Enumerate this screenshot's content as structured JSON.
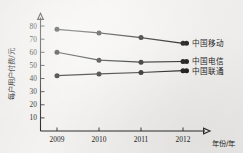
{
  "chart_data": {
    "type": "line",
    "title": "",
    "subtitle": "",
    "xlabel": "年份/年",
    "ylabel": "每户用户付费/元",
    "x": [
      "2009",
      "2010",
      "2011",
      "2012"
    ],
    "xtick_labels": [
      "2009",
      "2010",
      "2011",
      "2012"
    ],
    "ytick_labels": [
      "10",
      "20",
      "30",
      "40",
      "50",
      "60",
      "70",
      "80"
    ],
    "ytick_values": [
      10,
      20,
      30,
      40,
      50,
      60,
      70,
      80
    ],
    "ylim": [
      0,
      85
    ],
    "grid": false,
    "legend_position": "right",
    "marker": "filled-circle",
    "series": [
      {
        "name": "中国移动",
        "values": [
          77.5,
          74.8,
          71.2,
          66.8
        ],
        "color": "#131313"
      },
      {
        "name": "中国电信",
        "values": [
          60.0,
          54.0,
          52.5,
          53.0
        ],
        "color": "#131313"
      },
      {
        "name": "中国联通",
        "values": [
          42.2,
          43.5,
          44.6,
          46.0
        ],
        "color": "#131313"
      }
    ],
    "annotations": []
  },
  "legend": {
    "entries": [
      {
        "label": "中国移动"
      },
      {
        "label": "中国电信"
      },
      {
        "label": "中国联通"
      }
    ]
  }
}
